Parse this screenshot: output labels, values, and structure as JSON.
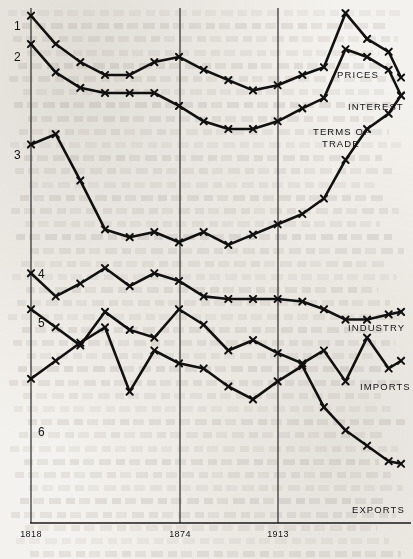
{
  "chart_data": {
    "type": "line",
    "title": "",
    "subtitle": "",
    "xlabel": "",
    "ylabel": "",
    "grid": true,
    "legend_position": "right-inline",
    "x_tick_labels": [
      "1818",
      "1874",
      "1913"
    ],
    "x_tick_years": [
      1818,
      1874,
      1913
    ],
    "xlim": [
      1818,
      1938
    ],
    "ylim": [
      0,
      100
    ],
    "y_axis_visible": false,
    "note": "Index series, unlabeled vertical scale; each curve offset vertically for comparison. Values below are read off the plot as relative index levels (0 = bottom of plot, 100 = top of plot).",
    "series": [
      {
        "number": "1",
        "name": "PRICES",
        "label_right": "PRICES",
        "x": [
          1818,
          1826,
          1834,
          1842,
          1850,
          1858,
          1866,
          1874,
          1882,
          1890,
          1898,
          1906,
          1913,
          1920,
          1927,
          1934,
          1938
        ],
        "values": [
          98.5,
          93.0,
          89.5,
          87.0,
          87.0,
          89.5,
          90.5,
          88.0,
          86.0,
          84.0,
          85.0,
          87.0,
          88.5,
          99.0,
          94.0,
          91.5,
          86.5
        ]
      },
      {
        "number": "2",
        "name": "INTEREST",
        "label_right": "INTEREST",
        "x": [
          1818,
          1826,
          1834,
          1842,
          1850,
          1858,
          1866,
          1874,
          1882,
          1890,
          1898,
          1906,
          1913,
          1920,
          1927,
          1934,
          1938
        ],
        "values": [
          93.0,
          87.5,
          84.5,
          83.5,
          83.5,
          83.5,
          81.0,
          78.0,
          76.5,
          76.5,
          78.0,
          80.5,
          82.5,
          92.0,
          90.5,
          88.0,
          83.0
        ]
      },
      {
        "number": "3",
        "name": "TERMS OF TRADE",
        "label_right": "TERMS OF TRADE",
        "x": [
          1818,
          1826,
          1834,
          1842,
          1850,
          1858,
          1866,
          1874,
          1882,
          1890,
          1898,
          1906,
          1913,
          1920,
          1927,
          1934,
          1938
        ],
        "values": [
          73.5,
          75.5,
          66.5,
          57.0,
          55.5,
          56.5,
          54.5,
          56.5,
          54.0,
          56.0,
          58.0,
          60.0,
          63.0,
          70.5,
          76.5,
          79.5,
          83.0
        ]
      },
      {
        "number": "4",
        "name": "INDUSTRY",
        "label_right": "INDUSTRY",
        "x": [
          1818,
          1826,
          1834,
          1842,
          1850,
          1858,
          1866,
          1874,
          1882,
          1890,
          1898,
          1906,
          1913,
          1920,
          1927,
          1934,
          1938
        ],
        "values": [
          48.5,
          44.0,
          46.5,
          49.5,
          46.0,
          48.5,
          47.0,
          44.0,
          43.5,
          43.5,
          43.5,
          43.0,
          41.5,
          39.5,
          39.5,
          40.5,
          41.0
        ]
      },
      {
        "number": "5",
        "name": "IMPORTS",
        "label_right": "IMPORTS",
        "x": [
          1818,
          1826,
          1834,
          1842,
          1850,
          1858,
          1866,
          1874,
          1882,
          1890,
          1898,
          1906,
          1913,
          1920,
          1927,
          1934,
          1938
        ],
        "values": [
          41.5,
          38.0,
          34.5,
          41.0,
          37.5,
          36.0,
          41.5,
          38.5,
          33.5,
          35.5,
          33.0,
          31.0,
          33.5,
          27.5,
          36.0,
          30.0,
          31.5
        ]
      },
      {
        "number": "6",
        "name": "EXPORTS",
        "label_right": "EXPORTS",
        "x": [
          1818,
          1826,
          1834,
          1842,
          1850,
          1858,
          1866,
          1874,
          1882,
          1890,
          1898,
          1906,
          1913,
          1920,
          1927,
          1934,
          1938
        ],
        "values": [
          28.0,
          31.5,
          35.0,
          38.0,
          25.5,
          33.5,
          31.0,
          30.0,
          26.5,
          24.0,
          27.5,
          30.5,
          22.5,
          18.0,
          15.0,
          12.0,
          11.5
        ]
      }
    ]
  },
  "axis": {
    "ticks": [
      {
        "label": "1818",
        "x_px": 31
      },
      {
        "label": "1874",
        "x_px": 180
      },
      {
        "label": "1913",
        "x_px": 278
      }
    ],
    "baseline_y_px": 523,
    "left_x_px": 31,
    "right_x_px": 401,
    "top_y_px": 8
  },
  "series_numbers": [
    {
      "text": "1",
      "x_px": 14,
      "y_px": 30
    },
    {
      "text": "2",
      "x_px": 14,
      "y_px": 61
    },
    {
      "text": "3",
      "x_px": 14,
      "y_px": 159
    },
    {
      "text": "4",
      "x_px": 38,
      "y_px": 278
    },
    {
      "text": "5",
      "x_px": 38,
      "y_px": 327
    },
    {
      "text": "6",
      "x_px": 38,
      "y_px": 436
    }
  ],
  "right_labels": [
    {
      "text": "PRICES",
      "x_px": 337,
      "y_px": 78
    },
    {
      "text": "INTEREST",
      "x_px": 348,
      "y_px": 110
    },
    {
      "text": "TERMS OF",
      "x_px": 313,
      "y_px": 135
    },
    {
      "text": "TRADE",
      "x_px": 322,
      "y_px": 147
    },
    {
      "text": "INDUSTRY",
      "x_px": 348,
      "y_px": 331
    },
    {
      "text": "IMPORTS",
      "x_px": 360,
      "y_px": 390
    },
    {
      "text": "EXPORTS",
      "x_px": 352,
      "y_px": 513
    }
  ]
}
